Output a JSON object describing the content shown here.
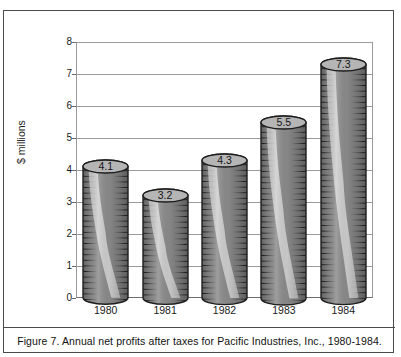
{
  "figure": {
    "caption": "Figure 7.  Annual net profits after taxes for Pacific Industries, Inc., 1980-1984."
  },
  "chart_data": {
    "type": "bar",
    "title": "",
    "subtitle": "",
    "categories": [
      "1980",
      "1981",
      "1982",
      "1983",
      "1984"
    ],
    "values": [
      4.1,
      3.2,
      4.3,
      5.5,
      7.3
    ],
    "data_labels": [
      "4.1",
      "3.2",
      "4.3",
      "5.5",
      "7.3"
    ],
    "xlabel": "",
    "ylabel": "$ millions",
    "ylim": [
      0,
      8
    ],
    "ytick_labels": [
      "8",
      "7",
      "6",
      "5",
      "4",
      "3",
      "2",
      "1",
      "0"
    ],
    "ytick_values": [
      8,
      7,
      6,
      5,
      4,
      3,
      2,
      1,
      0
    ],
    "grid": "horizontal",
    "legend": "none",
    "style": "3d-cylinder",
    "colors": {
      "bar_fill": "#8c8c8c",
      "bar_shade_dark": "#6f6f6f",
      "bar_highlight": "#f2f2f2",
      "bar_cap": "#b5b5b5",
      "bar_outline": "#1e1e1e",
      "gridline": "#9a9a9a",
      "axis": "#6d6d6d",
      "frame": "#4a4a4a",
      "text": "#111111",
      "background": "#ffffff"
    }
  }
}
